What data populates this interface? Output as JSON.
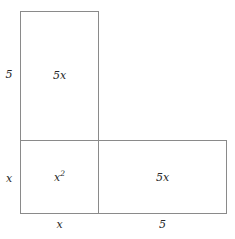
{
  "figure": {
    "kind": "area-model-diagram",
    "line_color": "#8a8a8a",
    "text_color": "#262626",
    "background_color": "#ffffff"
  },
  "areas": {
    "top": "5x",
    "bottom_left_base": "x",
    "bottom_left_exponent": "2",
    "bottom_right": "5x"
  },
  "dimensions": {
    "left_top": "5",
    "left_bottom": "x",
    "bottom_left": "x",
    "bottom_right": "5"
  }
}
